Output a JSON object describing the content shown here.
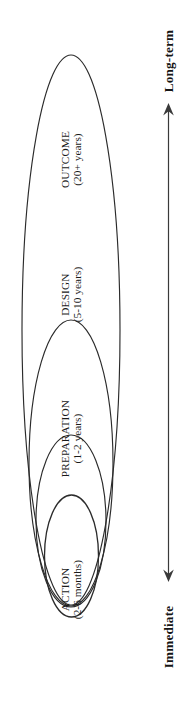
{
  "diagram": {
    "orientation": "rotated-90-ccw",
    "background_color": "#ffffff",
    "line_color": "#2b2b2b",
    "text_color": "#1a1a1a",
    "stages": [
      {
        "key": "outcome",
        "name": "OUTCOME",
        "timespan": "(20+ years)",
        "level": 4,
        "ring": "outermost"
      },
      {
        "key": "design",
        "name": "DESIGN",
        "timespan": "(5-10 years)",
        "level": 3,
        "ring": "third"
      },
      {
        "key": "preparation",
        "name": "PREPARATION",
        "timespan": "(1-2 years)",
        "level": 2,
        "ring": "second"
      },
      {
        "key": "action",
        "name": "ACTION",
        "timespan": "(2-6 months)",
        "level": 1,
        "ring": "innermost"
      }
    ],
    "axis": {
      "name": "time-horizon-axis",
      "top_label": "Long-term",
      "bottom_label": "Immediate",
      "double_headed": true
    }
  }
}
